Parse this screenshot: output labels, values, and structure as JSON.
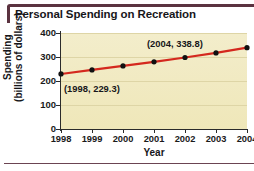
{
  "chart": {
    "title": "Personal Spending on Recreation"
  },
  "chart_data": {
    "type": "line",
    "title": "Personal Spending on Recreation",
    "xlabel": "Year",
    "ylabel": "Spending (billions of dollars)",
    "ylabel_line1": "Spending",
    "ylabel_line2": "(billions of dollars)",
    "x": [
      1998,
      1999,
      2000,
      2001,
      2002,
      2003,
      2004
    ],
    "categories": [
      "1998",
      "1999",
      "2000",
      "2001",
      "2002",
      "2003",
      "2004"
    ],
    "values": [
      229.3,
      246.0,
      263.0,
      280.0,
      298.0,
      317.0,
      338.8
    ],
    "xlim": [
      1998,
      2004
    ],
    "ylim": [
      0,
      400
    ],
    "yticks": [
      0,
      100,
      200,
      300,
      400
    ],
    "ytick_labels": [
      "0",
      "100",
      "200",
      "300",
      "400"
    ],
    "xticks": [
      1998,
      1999,
      2000,
      2001,
      2002,
      2003,
      2004
    ],
    "xtick_labels": [
      "1998",
      "1999",
      "2000",
      "2001",
      "2002",
      "2003",
      "2004"
    ],
    "grid": "horizontal",
    "legend": "none",
    "annotations": [
      {
        "label": "(1998, 229.3)",
        "x": 1998,
        "y": 229.3
      },
      {
        "label": "(2004, 338.8)",
        "x": 2004,
        "y": 338.8
      }
    ],
    "colors": {
      "line": "#d4281e",
      "marker": "#111111",
      "plot_background": "#f2ebc4",
      "gridline": "#ded5a6",
      "axis": "#2b2b2b",
      "title_rule": "#5b3340",
      "text": "#17161a"
    }
  }
}
